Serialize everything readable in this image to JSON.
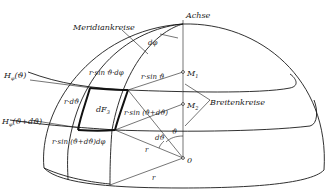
{
  "figure": {
    "type": "hemisphere-surface-element",
    "labels": {
      "axis": "Achse",
      "meridians": "Meridiankreise",
      "latitudes": "Breitenkreise",
      "d_phi": "dφ",
      "m1": "M",
      "m1_sub": "1",
      "m2": "M",
      "m2_sub": "2",
      "origin": "0",
      "h_phi_top": "H",
      "h_phi_top_sub": "φ",
      "h_phi_top_arg": "(ϑ)",
      "h_phi_bottom": "H",
      "h_phi_bottom_sub": "φ",
      "h_phi_bottom_arg": "(ϑ+dϑ)",
      "r_dtheta": "r·dϑ",
      "r_sin_theta_dphi": "r·sin ϑ·dφ",
      "r_sin_theta": "r·sin ϑ",
      "r_sin_theta_dtheta": "r·sin (ϑ+dϑ)",
      "r_sin_theta_dtheta_dphi": "r·sin (ϑ+dϑ)dφ",
      "dF": "dF",
      "dF_sub": "3",
      "theta": "ϑ",
      "d_theta": "dϑ",
      "r1": "r",
      "r2": "r"
    }
  }
}
